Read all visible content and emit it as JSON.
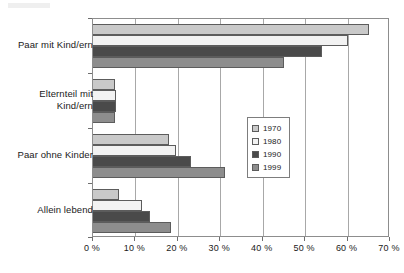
{
  "chart_data": {
    "type": "bar",
    "orientation": "horizontal",
    "title": "",
    "xlabel": "",
    "ylabel": "",
    "xlim": [
      0,
      70
    ],
    "xtick_labels": [
      "0 %",
      "10 %",
      "20 %",
      "30 %",
      "40 %",
      "50 %",
      "60 %",
      "70 %"
    ],
    "xticks": [
      0,
      10,
      20,
      30,
      40,
      50,
      60,
      70
    ],
    "grid": true,
    "legend_position": "center-right",
    "categories": [
      "Paar mit Kind/ern",
      "Elternteil mit Kind/ern",
      "Paar ohne Kinder",
      "Allein lebend"
    ],
    "category_lines": [
      [
        "Paar mit Kind/ern"
      ],
      [
        "Elternteil mit",
        "Kind/ern"
      ],
      [
        "Paar ohne Kinder"
      ],
      [
        "Allein lebend"
      ]
    ],
    "series": [
      {
        "name": "1970",
        "color": "#c9c9c9",
        "values": [
          65.0,
          5.2,
          18.0,
          6.2
        ]
      },
      {
        "name": "1980",
        "color": "#f2f2f2",
        "values": [
          60.0,
          5.4,
          19.5,
          11.5
        ]
      },
      {
        "name": "1990",
        "color": "#4a4a4a",
        "values": [
          54.0,
          5.5,
          23.0,
          13.5
        ]
      },
      {
        "name": "1999",
        "color": "#8d8d8d",
        "values": [
          45.0,
          5.2,
          31.0,
          18.5
        ]
      }
    ]
  },
  "legend": {
    "items": [
      {
        "label": "1970",
        "color": "#c9c9c9"
      },
      {
        "label": "1980",
        "color": "#f2f2f2"
      },
      {
        "label": "1990",
        "color": "#4a4a4a"
      },
      {
        "label": "1999",
        "color": "#8d8d8d"
      }
    ]
  }
}
